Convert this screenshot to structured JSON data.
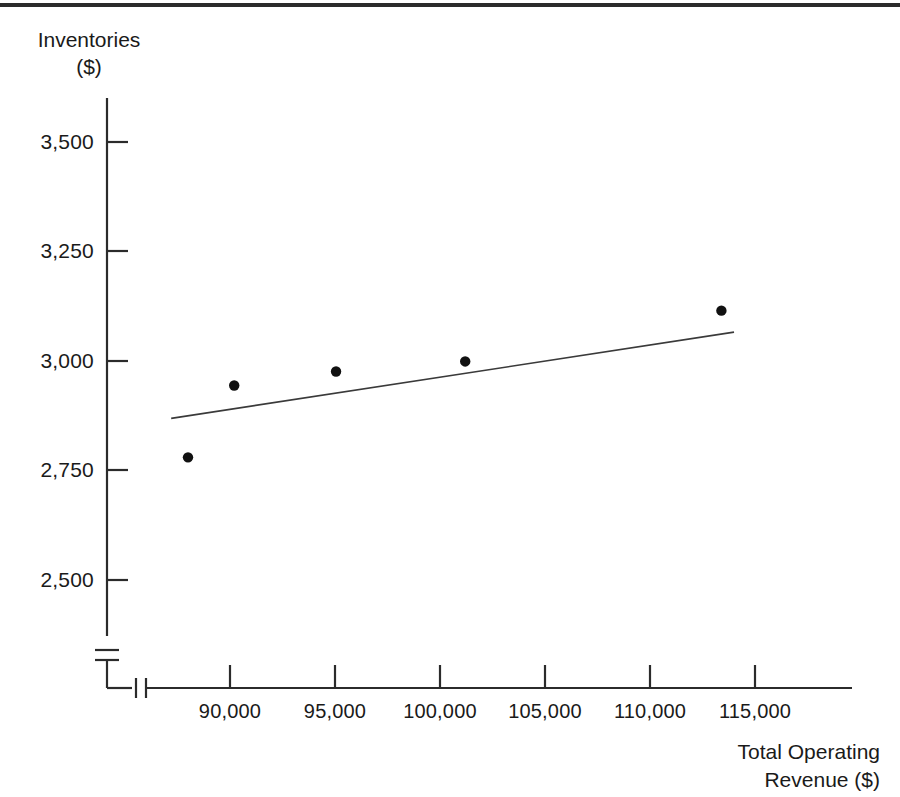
{
  "figure": {
    "y_axis_title": "Inventories\n($)",
    "x_axis_title": "Total Operating\nRevenue ($)"
  },
  "axes": {
    "y_tick_labels": [
      "3,500",
      "3,250",
      "3,000",
      "2,750",
      "2,500"
    ],
    "x_tick_labels": [
      "90,000",
      "95,000",
      "100,000",
      "105,000",
      "110,000",
      "115,000"
    ],
    "y_axis_break": true,
    "x_axis_break": true
  },
  "chart_data": {
    "type": "scatter",
    "title": "",
    "xlabel": "Total Operating Revenue ($)",
    "ylabel": "Inventories ($)",
    "xlim": [
      86000,
      120000
    ],
    "ylim": [
      2380,
      3660
    ],
    "grid": false,
    "legend": "none",
    "x_ticks": [
      90000,
      95000,
      100000,
      105000,
      110000,
      115000
    ],
    "y_ticks": [
      2500,
      2750,
      3000,
      3250,
      3500
    ],
    "x_tick_labels": [
      "90,000",
      "95,000",
      "100,000",
      "105,000",
      "110,000",
      "115,000"
    ],
    "y_tick_labels": [
      "2,500",
      "2,750",
      "3,000",
      "3,250",
      "3,500"
    ],
    "series": [
      {
        "name": "Observations",
        "type": "scatter",
        "marker": "filled-circle",
        "color": "#111111",
        "points": [
          {
            "x": 88000,
            "y": 2780
          },
          {
            "x": 90200,
            "y": 2944
          },
          {
            "x": 95050,
            "y": 2976
          },
          {
            "x": 101200,
            "y": 2999
          },
          {
            "x": 113400,
            "y": 3115
          }
        ]
      },
      {
        "name": "Trend line",
        "type": "line",
        "color": "#3a3a3a",
        "points": [
          {
            "x": 87200,
            "y": 2869
          },
          {
            "x": 114000,
            "y": 3066
          }
        ]
      }
    ]
  },
  "colors": {
    "axis": "#2b2b2b",
    "marker": "#111111",
    "trend_line": "#3a3a3a",
    "text": "#1a1a1a",
    "background": "#ffffff"
  }
}
